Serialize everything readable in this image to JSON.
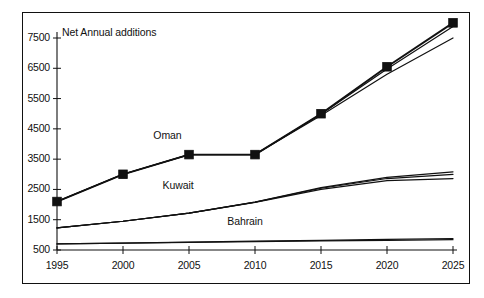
{
  "chart_data": {
    "type": "line",
    "title": "Net Annual additions",
    "xlabel": "",
    "ylabel": "",
    "x": [
      1995,
      2000,
      2005,
      2010,
      2015,
      2020,
      2025
    ],
    "xtick_labels": [
      "1995",
      "2000",
      "2005",
      "2010",
      "2015",
      "2020",
      "2025"
    ],
    "ytick_labels": [
      "7500",
      "6500",
      "5500",
      "4500",
      "3500",
      "2500",
      "1500",
      "500"
    ],
    "ytick_values": [
      7500,
      6500,
      5500,
      4500,
      3500,
      2500,
      1500,
      500
    ],
    "ylim": [
      500,
      7500
    ],
    "xlim": [
      1995,
      2025
    ],
    "grid": false,
    "legend_position": "inline-annotations",
    "annotations": [
      {
        "text": "Oman",
        "x": 2002.3,
        "y": 4250
      },
      {
        "text": "Kuwait",
        "x": 2003.0,
        "y": 2620
      },
      {
        "text": "Bahrain",
        "x": 2007.9,
        "y": 1420
      }
    ],
    "series": [
      {
        "name": "Oman",
        "marker": "filled-square",
        "values": [
          2100,
          3000,
          3650,
          3650,
          5000,
          6550,
          8000
        ]
      },
      {
        "name": "Oman-variant-a",
        "marker": "none",
        "values": [
          2100,
          3000,
          3650,
          3650,
          4980,
          6480,
          7880
        ]
      },
      {
        "name": "Oman-variant-b",
        "marker": "none",
        "values": [
          2100,
          3000,
          3650,
          3650,
          4940,
          6300,
          7500
        ]
      },
      {
        "name": "Kuwait",
        "marker": "none",
        "values": [
          1230,
          1450,
          1720,
          2080,
          2560,
          2900,
          3080
        ]
      },
      {
        "name": "Kuwait-variant-a",
        "marker": "none",
        "values": [
          1230,
          1450,
          1720,
          2080,
          2540,
          2860,
          3000
        ]
      },
      {
        "name": "Kuwait-variant-b",
        "marker": "none",
        "values": [
          1230,
          1450,
          1720,
          2070,
          2500,
          2790,
          2860
        ]
      },
      {
        "name": "Bahrain",
        "marker": "none",
        "values": [
          700,
          730,
          760,
          790,
          820,
          850,
          880
        ]
      },
      {
        "name": "Bahrain-variant-a",
        "marker": "none",
        "values": [
          700,
          725,
          750,
          775,
          800,
          820,
          840
        ]
      }
    ]
  }
}
